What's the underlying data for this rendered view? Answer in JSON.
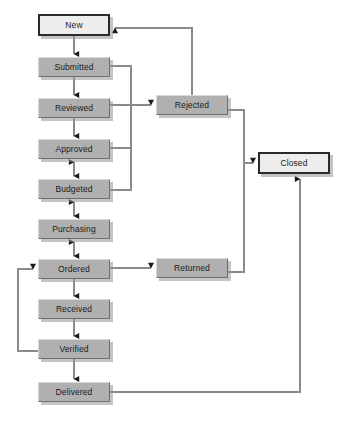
{
  "diagram": {
    "type": "state-transition-flowchart",
    "canvas": {
      "width": 353,
      "height": 423
    },
    "colors": {
      "state_fill": "#b0b0b0",
      "terminal_fill": "#ededed",
      "state_border_light": "#d9d9d9",
      "state_border_dark": "#6e6e6e",
      "terminal_border": "#2b2b2b",
      "edge_line": "#808080",
      "arrowhead": "#1a1a1a",
      "background": "#ffffff",
      "shadow": "rgba(150,150,150,0.55)"
    },
    "nodes": [
      {
        "id": "new",
        "label": "New",
        "kind": "terminal",
        "x": 38,
        "y": 14,
        "w": 72,
        "h": 22
      },
      {
        "id": "submitted",
        "label": "Submitted",
        "kind": "state",
        "x": 38,
        "y": 57,
        "w": 72,
        "h": 20
      },
      {
        "id": "reviewed",
        "label": "Reviewed",
        "kind": "state",
        "x": 38,
        "y": 98,
        "w": 72,
        "h": 20
      },
      {
        "id": "approved",
        "label": "Approved",
        "kind": "state",
        "x": 38,
        "y": 139,
        "w": 72,
        "h": 20
      },
      {
        "id": "budgeted",
        "label": "Budgeted",
        "kind": "state",
        "x": 38,
        "y": 179,
        "w": 72,
        "h": 20
      },
      {
        "id": "purchasing",
        "label": "Purchasing",
        "kind": "state",
        "x": 38,
        "y": 219,
        "w": 72,
        "h": 20
      },
      {
        "id": "ordered",
        "label": "Ordered",
        "kind": "state",
        "x": 38,
        "y": 259,
        "w": 72,
        "h": 20
      },
      {
        "id": "received",
        "label": "Received",
        "kind": "state",
        "x": 38,
        "y": 299,
        "w": 72,
        "h": 20
      },
      {
        "id": "verified",
        "label": "Verified",
        "kind": "state",
        "x": 38,
        "y": 339,
        "w": 72,
        "h": 20
      },
      {
        "id": "delivered",
        "label": "Delivered",
        "kind": "state",
        "x": 38,
        "y": 382,
        "w": 72,
        "h": 20
      },
      {
        "id": "rejected",
        "label": "Rejected",
        "kind": "state",
        "x": 156,
        "y": 95,
        "w": 72,
        "h": 20
      },
      {
        "id": "returned",
        "label": "Returned",
        "kind": "state",
        "x": 156,
        "y": 258,
        "w": 72,
        "h": 20
      },
      {
        "id": "closed",
        "label": "Closed",
        "kind": "terminal",
        "x": 258,
        "y": 152,
        "w": 72,
        "h": 22
      }
    ],
    "edges": [
      {
        "id": "new-to-submitted",
        "from": "new",
        "to": "submitted",
        "arrows": "single"
      },
      {
        "id": "submitted-to-reviewed",
        "from": "submitted",
        "to": "reviewed",
        "arrows": "single"
      },
      {
        "id": "reviewed-to-approved",
        "from": "reviewed",
        "to": "approved",
        "arrows": "single"
      },
      {
        "id": "approved-to-budgeted",
        "from": "approved",
        "to": "budgeted",
        "arrows": "double"
      },
      {
        "id": "budgeted-to-purchasing",
        "from": "budgeted",
        "to": "purchasing",
        "arrows": "double"
      },
      {
        "id": "purchasing-to-ordered",
        "from": "purchasing",
        "to": "ordered",
        "arrows": "double"
      },
      {
        "id": "ordered-to-received",
        "from": "ordered",
        "to": "received",
        "arrows": "single"
      },
      {
        "id": "received-to-verified",
        "from": "received",
        "to": "verified",
        "arrows": "single"
      },
      {
        "id": "verified-to-delivered",
        "from": "verified",
        "to": "delivered",
        "arrows": "single"
      },
      {
        "id": "verified-to-ordered",
        "from": "verified",
        "to": "ordered",
        "arrows": "single"
      },
      {
        "id": "submitted-to-rejected",
        "from": "submitted",
        "to": "rejected",
        "arrows": "single"
      },
      {
        "id": "reviewed-to-rejected",
        "from": "reviewed",
        "to": "rejected",
        "arrows": "single"
      },
      {
        "id": "approved-to-rejected",
        "from": "approved",
        "to": "rejected",
        "arrows": "single"
      },
      {
        "id": "budgeted-to-rejected",
        "from": "budgeted",
        "to": "rejected",
        "arrows": "single"
      },
      {
        "id": "rejected-to-new",
        "from": "rejected",
        "to": "new",
        "arrows": "single"
      },
      {
        "id": "rejected-to-closed",
        "from": "rejected",
        "to": "closed",
        "arrows": "single"
      },
      {
        "id": "ordered-to-returned",
        "from": "ordered",
        "to": "returned",
        "arrows": "single"
      },
      {
        "id": "returned-to-closed",
        "from": "returned",
        "to": "closed",
        "arrows": "single"
      },
      {
        "id": "delivered-to-closed",
        "from": "delivered",
        "to": "closed",
        "arrows": "single"
      }
    ]
  }
}
